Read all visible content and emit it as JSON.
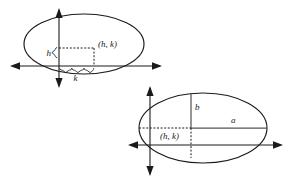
{
  "figure": {
    "background_color": "#ffffff",
    "stroke_color": "#1a1a1a",
    "measure_color": "#555555"
  },
  "diagrams": [
    {
      "id": "upper-left-ellipse",
      "description": "Ellipse with center offset from origin, showing h and k displacements",
      "center_label": "(h, k)",
      "offset_labels": {
        "vertical": "h",
        "horizontal": "k"
      }
    },
    {
      "id": "lower-right-ellipse",
      "description": "Ellipse with center at (h, k) showing semi-major axis a and semi-minor axis b",
      "center_label": "(h, k)",
      "axis_labels": {
        "semi_minor": "b",
        "semi_major": "a"
      }
    }
  ],
  "labels": {
    "top_center_point": "(h, k)",
    "top_h": "h",
    "top_k": "k",
    "bottom_center_point": "(h, k)",
    "bottom_b": "b",
    "bottom_a": "a"
  }
}
